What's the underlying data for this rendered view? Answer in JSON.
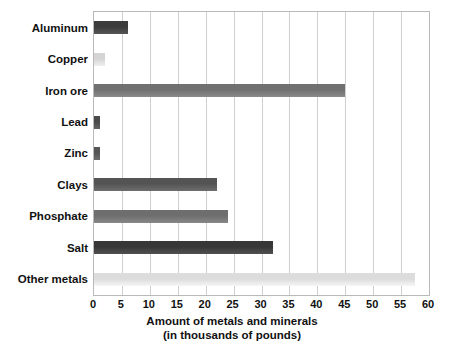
{
  "chart_data": {
    "type": "bar",
    "orientation": "horizontal",
    "title": "",
    "xlabel_line1": "Amount of metals and minerals",
    "xlabel_line2": "(in thousands of pounds)",
    "ylabel": "",
    "xlim": [
      0,
      60
    ],
    "xtick_step": 5,
    "grid": "vertical",
    "legend": "none",
    "categories": [
      "Aluminum",
      "Copper",
      "Iron ore",
      "Lead",
      "Zinc",
      "Clays",
      "Phosphate",
      "Salt",
      "Other metals"
    ],
    "values": [
      6,
      2,
      45,
      1,
      1,
      22,
      24,
      32,
      57.5
    ],
    "xticks": [
      "0",
      "5",
      "10",
      "15",
      "20",
      "25",
      "30",
      "35",
      "40",
      "45",
      "50",
      "55",
      "60"
    ],
    "bar_colors": [
      "#3c3c3c",
      "#d5d5d5",
      "#707070",
      "#4a4a4a",
      "#555555",
      "#545454",
      "#6e6e6e",
      "#373737",
      "#dcdcdc"
    ]
  },
  "style": {
    "frame_color": "#b9b9b9",
    "gridline_color": "#cfcfcf",
    "text_color": "#111111",
    "background": "#ffffff"
  }
}
